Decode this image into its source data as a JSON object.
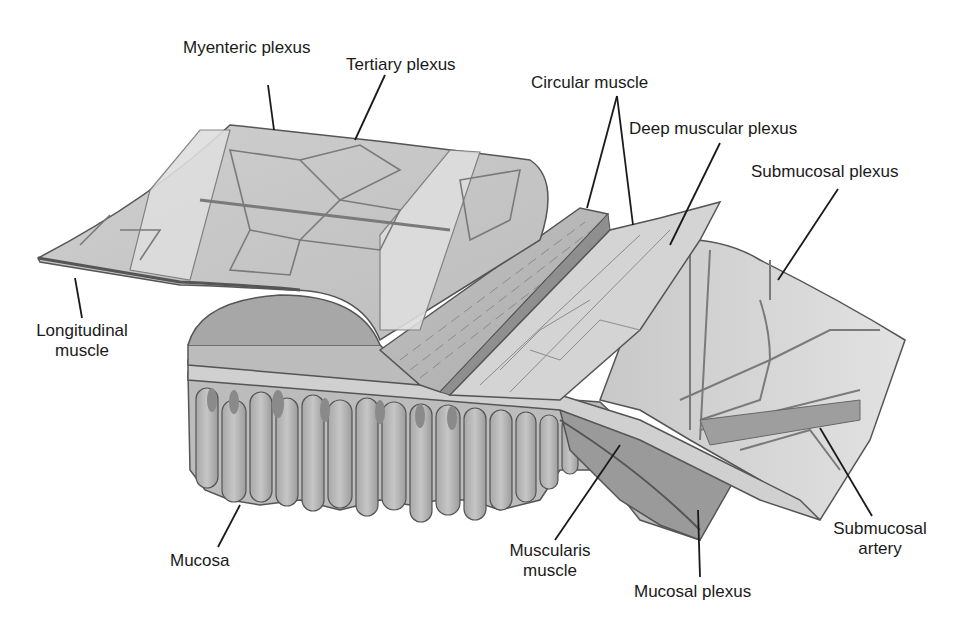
{
  "diagram": {
    "colors": {
      "background": "#ffffff",
      "tissue_light": "#d6d6d6",
      "tissue_mid": "#b8b8b8",
      "tissue_dark": "#8e8e8e",
      "outline": "#555555",
      "leader_line": "#1a1a1a",
      "label_text": "#1a1a1a"
    },
    "labels": {
      "myenteric_plexus": "Myenteric plexus",
      "tertiary_plexus": "Tertiary plexus",
      "circular_muscle": "Circular muscle",
      "deep_muscular_plexus": "Deep muscular plexus",
      "submucosal_plexus": "Submucosal plexus",
      "longitudinal_muscle_1": "Longitudinal",
      "longitudinal_muscle_2": "muscle",
      "mucosa": "Mucosa",
      "muscularis_muscle_1": "Muscularis",
      "muscularis_muscle_2": "muscle",
      "mucosal_plexus": "Mucosal plexus",
      "submucosal_artery_1": "Submucosal",
      "submucosal_artery_2": "artery"
    }
  }
}
